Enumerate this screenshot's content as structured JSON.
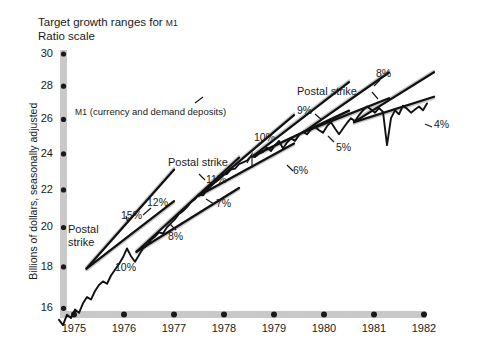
{
  "chart_data": {
    "type": "line",
    "title": "Target growth ranges for M1",
    "subtitle": "Ratio scale",
    "xlabel": "",
    "ylabel": "Billions of dollars, seasonally adjusted",
    "series_label_prefix": "M1",
    "series_label_rest": " (currency and demand deposits)",
    "grid": false,
    "legend": "none",
    "yscale": "log",
    "ylim": [
      15,
      30
    ],
    "xlim": [
      1974.6,
      1982.2
    ],
    "yticks": [
      30,
      28,
      26,
      24,
      22,
      20,
      18,
      16
    ],
    "xticks": [
      "1975",
      "1976",
      "1977",
      "1978",
      "1979",
      "1980",
      "1981",
      "1982"
    ],
    "series": [
      {
        "name": "M1 (currency and demand deposits)",
        "x": [
          1974.7,
          1974.78,
          1974.86,
          1974.94,
          1975.02,
          1975.1,
          1975.18,
          1975.26,
          1975.34,
          1975.42,
          1975.5,
          1975.58,
          1975.66,
          1975.74,
          1975.82,
          1975.9,
          1975.98,
          1976.06,
          1976.14,
          1976.22,
          1976.3,
          1976.38,
          1976.46,
          1976.54,
          1976.62,
          1976.7,
          1976.78,
          1976.86,
          1976.94,
          1977.02,
          1977.1,
          1977.18,
          1977.26,
          1977.34,
          1977.42,
          1977.5,
          1977.58,
          1977.66,
          1977.74,
          1977.82,
          1977.9,
          1977.98,
          1978.06,
          1978.14,
          1978.22,
          1978.3,
          1978.38,
          1978.46,
          1978.54,
          1978.62,
          1978.7,
          1978.78,
          1978.86,
          1978.94,
          1979.02,
          1979.1,
          1979.18,
          1979.26,
          1979.34,
          1979.42,
          1979.5,
          1979.58,
          1979.66,
          1979.74,
          1979.82,
          1979.9,
          1979.98,
          1980.06,
          1980.14,
          1980.22,
          1980.3,
          1980.38,
          1980.46,
          1980.54,
          1980.62,
          1980.7,
          1980.78,
          1980.86,
          1980.94,
          1981.02,
          1981.1,
          1981.18,
          1981.26,
          1981.34,
          1981.42,
          1981.5,
          1981.58,
          1981.66,
          1981.74,
          1981.82,
          1981.9,
          1981.98,
          1982.06
        ],
        "y": [
          15.55,
          15.35,
          15.75,
          15.62,
          15.95,
          15.82,
          16.2,
          16.45,
          16.35,
          16.7,
          16.95,
          17.1,
          17.0,
          17.35,
          17.6,
          17.85,
          18.15,
          18.55,
          18.2,
          17.95,
          18.25,
          18.55,
          18.7,
          18.95,
          19.1,
          19.3,
          19.25,
          19.55,
          19.75,
          19.95,
          20.2,
          20.35,
          20.55,
          20.8,
          20.95,
          21.2,
          21.15,
          21.45,
          21.65,
          21.85,
          22.0,
          22.25,
          22.3,
          22.55,
          22.6,
          22.85,
          22.95,
          23.05,
          23.3,
          23.25,
          23.45,
          23.55,
          23.8,
          23.6,
          23.95,
          24.2,
          23.75,
          24.1,
          24.35,
          24.2,
          24.55,
          24.75,
          24.6,
          24.9,
          25.05,
          24.85,
          24.7,
          25.1,
          25.35,
          24.95,
          24.6,
          24.95,
          25.3,
          25.6,
          25.4,
          25.8,
          26.1,
          26.35,
          26.15,
          25.95,
          26.25,
          26.0,
          23.95,
          25.6,
          26.1,
          25.85,
          26.4,
          26.2,
          25.95,
          26.15,
          26.35,
          26.1,
          26.55
        ],
        "color": "#111111"
      }
    ],
    "target_cones": [
      {
        "id": "cone-1",
        "x_start": 1975.25,
        "y_start": 17.65,
        "x_end": 1977.0,
        "upper_rate_label": "15%",
        "lower_rate_label": "10%",
        "upper_rate": 15,
        "lower_rate": 10
      },
      {
        "id": "cone-2",
        "x_start": 1976.25,
        "y_start": 18.4,
        "x_end": 1978.3,
        "upper_rate_label": "12%",
        "lower_rate_label": "8%",
        "upper_rate": 12,
        "lower_rate": 8
      },
      {
        "id": "cone-3",
        "x_start": 1977.5,
        "y_start": 21.15,
        "x_end": 1979.4,
        "upper_rate_label": "11%",
        "lower_rate_label": "7%",
        "upper_rate": 11,
        "lower_rate": 7
      },
      {
        "id": "cone-4",
        "x_start": 1978.6,
        "y_start": 23.35,
        "x_end": 1980.5,
        "upper_rate_label": "10%",
        "lower_rate_label": "6%",
        "upper_rate": 10,
        "lower_rate": 6
      },
      {
        "id": "cone-5",
        "x_start": 1979.6,
        "y_start": 24.75,
        "x_end": 1981.3,
        "upper_rate_label": "9%",
        "lower_rate_label": "5%",
        "upper_rate": 9,
        "lower_rate": 5
      },
      {
        "id": "cone-6",
        "x_start": 1980.6,
        "y_start": 25.35,
        "x_end": 1982.2,
        "upper_rate_label": "8%",
        "lower_rate_label": "4%",
        "upper_rate": 8,
        "lower_rate": 4
      }
    ],
    "annotations": [
      {
        "id": "rate-15",
        "text": "15%"
      },
      {
        "id": "rate-10",
        "text": "10%"
      },
      {
        "id": "rate-12",
        "text": "12%"
      },
      {
        "id": "rate-8-left",
        "text": "8%"
      },
      {
        "id": "rate-11",
        "text": "11%"
      },
      {
        "id": "rate-7",
        "text": "7%"
      },
      {
        "id": "rate-10b",
        "text": "10%"
      },
      {
        "id": "rate-6",
        "text": "6%"
      },
      {
        "id": "rate-9",
        "text": "9%"
      },
      {
        "id": "rate-5",
        "text": "5%"
      },
      {
        "id": "rate-8-right",
        "text": "8%"
      },
      {
        "id": "rate-4",
        "text": "4%"
      }
    ],
    "event_markers": [
      {
        "id": "postal-strike-1",
        "line1": "Postal",
        "line2": "strike"
      },
      {
        "id": "postal-strike-2",
        "text": "Postal strike"
      },
      {
        "id": "postal-strike-3",
        "text": "Postal strike"
      }
    ],
    "colors": {
      "series": "#111111",
      "target_line": "#111111",
      "target_band": "#c8c8c8",
      "axis": "#c9c9c9",
      "tick_dot": "#1a1a1a",
      "text": "#1a1a1a",
      "background": "#ffffff"
    }
  }
}
